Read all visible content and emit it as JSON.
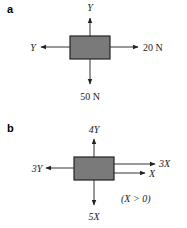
{
  "panels": [
    {
      "label": "a",
      "forces": {
        "up": "Y",
        "left": "Y",
        "right": "20 N",
        "down": "50 N"
      }
    },
    {
      "label": "b",
      "forces": {
        "up": "4Y",
        "left": "3Y",
        "right_upper": "3X",
        "right_lower": "X",
        "down": "5X"
      },
      "condition": "(X > 0)"
    }
  ],
  "colors": {
    "box_fill": "#7a7a7a",
    "line": "#333333"
  }
}
